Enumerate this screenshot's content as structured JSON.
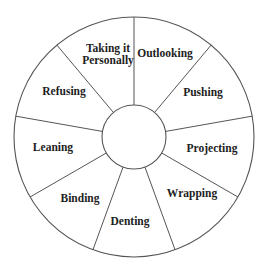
{
  "diagram": {
    "type": "wheel",
    "center": [
      134,
      137
    ],
    "outer_radius": 120,
    "inner_radius": 32,
    "start_angle_deg": -90,
    "segment_count": 9,
    "line_color": "#555555",
    "text_color": "#1e1e1e",
    "hub_label": "",
    "segments": [
      {
        "label": "Outlooking",
        "lines": [
          "Outlooking"
        ],
        "pos": [
          165,
          53
        ]
      },
      {
        "label": "Pushing",
        "lines": [
          "Pushing"
        ],
        "pos": [
          203,
          92
        ]
      },
      {
        "label": "Projecting",
        "lines": [
          "Projecting"
        ],
        "pos": [
          212,
          148
        ]
      },
      {
        "label": "Wrapping",
        "lines": [
          "Wrapping"
        ],
        "pos": [
          192,
          193
        ]
      },
      {
        "label": "Denting",
        "lines": [
          "Denting"
        ],
        "pos": [
          130,
          221
        ]
      },
      {
        "label": "Binding",
        "lines": [
          "Binding"
        ],
        "pos": [
          80,
          198
        ]
      },
      {
        "label": "Leaning",
        "lines": [
          "Leaning"
        ],
        "pos": [
          53,
          147
        ]
      },
      {
        "label": "Refusing",
        "lines": [
          "Refusing"
        ],
        "pos": [
          64,
          91
        ]
      },
      {
        "label": "Taking it Personally",
        "lines": [
          "Taking it",
          "Personally"
        ],
        "pos": [
          108,
          54
        ]
      }
    ]
  }
}
